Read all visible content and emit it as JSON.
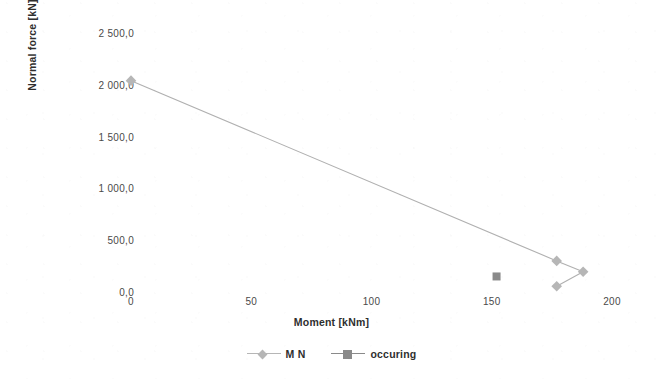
{
  "chart_data": {
    "type": "line",
    "title": "",
    "subtitle": "",
    "xlabel": "Moment [kNm]",
    "ylabel": "Normal force [kN]",
    "xlim": [
      0,
      200
    ],
    "ylim": [
      0,
      2500
    ],
    "xticks": [
      0,
      50,
      100,
      150,
      200
    ],
    "xtick_labels": [
      "0",
      "50",
      "100",
      "150",
      "200"
    ],
    "yticks": [
      0,
      500,
      1000,
      1500,
      2000,
      2500
    ],
    "ytick_labels": [
      "0,0",
      "500,0",
      "1 000,0",
      "1 500,0",
      "2 000,0",
      "2 500,0"
    ],
    "grid": false,
    "legend_position": "bottom",
    "series": [
      {
        "name": "M N",
        "type": "line",
        "color": "#b0b0b0",
        "marker": "diamond",
        "marker_color": "#b6b6b6",
        "points": [
          {
            "x": 0,
            "y": 2040
          },
          {
            "x": 177,
            "y": 300
          },
          {
            "x": 188,
            "y": 195
          },
          {
            "x": 177,
            "y": 55
          }
        ]
      },
      {
        "name": "occuring",
        "type": "scatter",
        "color": "#8a8a8a",
        "marker": "square",
        "marker_color": "#8a8a8a",
        "points": [
          {
            "x": 152,
            "y": 150
          }
        ]
      }
    ]
  },
  "axes": {
    "y_title": "Normal force [kN]",
    "x_title": "Moment [kNm]"
  },
  "legend": {
    "entries": [
      {
        "label": "M N",
        "color": "#b6b6b6",
        "marker": "diamond"
      },
      {
        "label": "occuring",
        "color": "#8a8a8a",
        "marker": "square"
      }
    ]
  }
}
